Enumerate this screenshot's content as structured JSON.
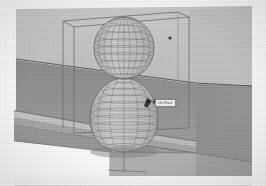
{
  "app": {
    "view_type": "3d-perspective-viewport",
    "render_style": "shaded-with-hidden-line-wireframe"
  },
  "scene": {
    "title": "Lathed revolve solid in selection bounding box",
    "colors": {
      "background": "#ffffff",
      "wall_light": "#c9c9c7",
      "wall_shadow": "#bcbcba",
      "ground_dark": "#949492",
      "ground_mid": "#9d9d9b",
      "slab_top": "#c4c4c2",
      "slab_face": "#a8a8a6",
      "edge_line": "#5d5d5d",
      "bbox_line": "#6e6e6e",
      "mesh_line": "#6b6b6b",
      "solid_fill": "#c0c0be",
      "tooltip_bg": "#f2f2f0",
      "tooltip_border": "#8a8a88",
      "tooltip_text": "#4a4a4a",
      "marker_dot": "#3a3a3a"
    },
    "objects": [
      {
        "name": "back-wall",
        "label": "Back wall plane"
      },
      {
        "name": "ground-plane",
        "label": "Ground plane"
      },
      {
        "name": "ledge-slab",
        "label": "Horizontal ledge slab"
      },
      {
        "name": "selection-bbox",
        "label": "Selection bounding box"
      },
      {
        "name": "revolve-solid",
        "label": "Revolved gourd solid"
      },
      {
        "name": "sphere-lobe",
        "label": "Upper spherical lobe"
      },
      {
        "name": "bulb-lobe",
        "label": "Lower bulb lobe"
      },
      {
        "name": "axis-line",
        "label": "Vertical axis of revolution"
      }
    ],
    "mesh": {
      "longitude_count": 14,
      "latitude_count_upper": 9,
      "latitude_count_lower": 13
    }
  },
  "tooltip": {
    "text": "On Face",
    "visible": true
  },
  "markers": {
    "endpoint_dot": {
      "x": 170,
      "y": 38,
      "label": "endpoint"
    },
    "cursor": {
      "x": 148,
      "y": 101,
      "label": "pencil-cursor"
    }
  }
}
